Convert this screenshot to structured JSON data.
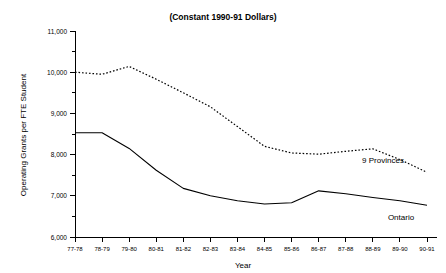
{
  "chart_data": {
    "type": "line",
    "title": "(Constant 1990-91 Dollars)",
    "xlabel": "Year",
    "ylabel": "Operating Grants per FTE Student",
    "ylim": [
      6000,
      11000
    ],
    "ytick_step": 1000,
    "yminor_step": 500,
    "grid": false,
    "legend_position": "inline-right",
    "categories": [
      "77-78",
      "78-79",
      "79-80",
      "80-81",
      "81-82",
      "82-83",
      "83-84",
      "84-85",
      "85-86",
      "86-87",
      "87-88",
      "88-89",
      "89-90",
      "90-91"
    ],
    "ytick_labels": [
      "6,000",
      "7,000",
      "8,000",
      "9,000",
      "10,000",
      "11,000"
    ],
    "ytick_values": [
      6000,
      7000,
      8000,
      9000,
      10000,
      11000
    ],
    "series": [
      {
        "name": "9 Provinces",
        "style": "dotted",
        "values": [
          10000,
          9950,
          10140,
          9830,
          9500,
          9160,
          8680,
          8200,
          8040,
          8010,
          8080,
          8140,
          7880,
          7570
        ]
      },
      {
        "name": "Ontario",
        "style": "solid",
        "values": [
          8530,
          8530,
          8150,
          7620,
          7180,
          7000,
          6880,
          6800,
          6830,
          7120,
          7050,
          6960,
          6880,
          6770
        ]
      }
    ],
    "annotations": [
      {
        "text": "9 Provinces",
        "series": "9 Provinces"
      },
      {
        "text": "Ontario",
        "series": "Ontario"
      }
    ]
  }
}
